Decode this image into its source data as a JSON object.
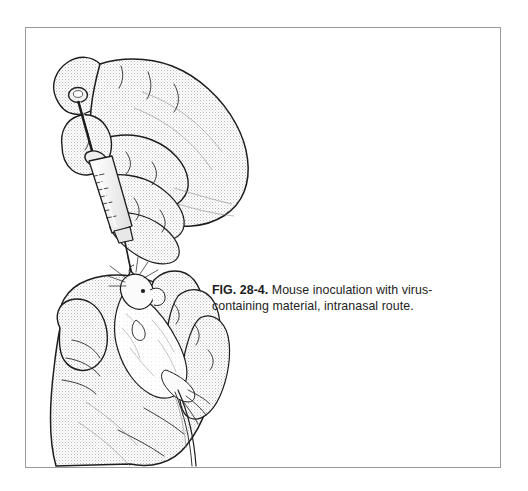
{
  "figure": {
    "caption_label": "FIG. 28-4.",
    "caption_text": " Mouse inoculation with virus-containing material, intranasal route.",
    "frame_border_color": "#9a9a9a",
    "background_color": "#ffffff",
    "ink_color": "#1d1d1d"
  },
  "illustration": {
    "title": "Mouse inoculation, intranasal route",
    "description": "Line drawing: an upper hand holds a hypodermic syringe with the thumb on the plunger; a droplet falls from the needle tip onto the nose of a mouse restrained in a lower hand.",
    "elements": [
      {
        "name": "upper-hand",
        "label": "Hand holding syringe"
      },
      {
        "name": "syringe",
        "label": "Hypodermic syringe with graduated barrel"
      },
      {
        "name": "syringe-plunger",
        "label": "Plunger pressed by thumb"
      },
      {
        "name": "needle",
        "label": "Needle"
      },
      {
        "name": "droplet",
        "label": "Inoculum droplet"
      },
      {
        "name": "mouse",
        "label": "Restrained mouse"
      },
      {
        "name": "lower-hand",
        "label": "Hand restraining mouse"
      }
    ]
  }
}
